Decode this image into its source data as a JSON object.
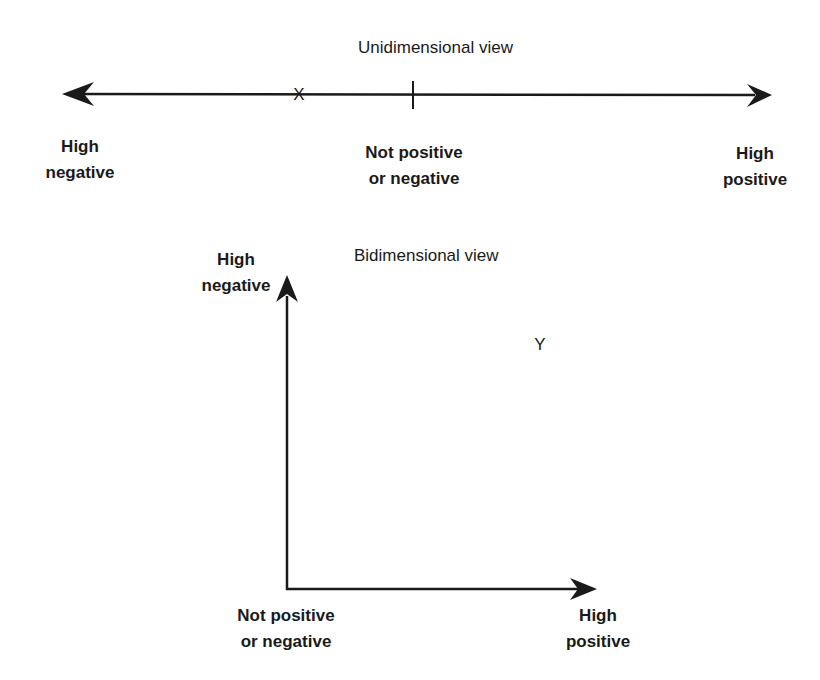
{
  "unidimensional": {
    "title": "Unidimensional view",
    "marker_x": "X",
    "left_label": [
      "High",
      "negative"
    ],
    "center_label": [
      "Not positive",
      "or negative"
    ],
    "right_label": [
      "High",
      "positive"
    ]
  },
  "bidimensional": {
    "title": "Bidimensional view",
    "marker_y": "Y",
    "y_axis_label": [
      "High",
      "negative"
    ],
    "origin_label": [
      "Not positive",
      "or negative"
    ],
    "x_axis_label": [
      "High",
      "positive"
    ]
  },
  "colors": {
    "line": "#1a1a1a",
    "background": "#ffffff"
  }
}
